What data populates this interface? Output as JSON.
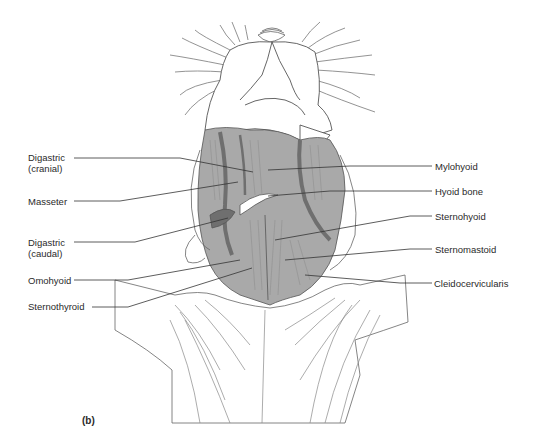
{
  "figure": {
    "panel_label": "(b)",
    "colors": {
      "muscle_fill": "#a9a9a9",
      "muscle_dark": "#6f6f6f",
      "muscle_shadow": "#8a8a8a",
      "outline": "#555555",
      "leader_line": "#333333",
      "background": "#ffffff"
    },
    "labels_left": [
      {
        "id": "digastric-cranial",
        "line1": "Digastric",
        "line2": "(cranial)"
      },
      {
        "id": "masseter",
        "line1": "Masseter",
        "line2": ""
      },
      {
        "id": "digastric-caudal",
        "line1": "Digastric",
        "line2": "(caudal)"
      },
      {
        "id": "omohyoid",
        "line1": "Omohyoid",
        "line2": ""
      },
      {
        "id": "sternothyroid",
        "line1": "Sternothyroid",
        "line2": ""
      }
    ],
    "labels_right": [
      {
        "id": "mylohyoid",
        "text": "Mylohyoid"
      },
      {
        "id": "hyoid-bone",
        "text": "Hyoid bone"
      },
      {
        "id": "sternohyoid",
        "text": "Sternohyoid"
      },
      {
        "id": "sternomastoid",
        "text": "Sternomastoid"
      },
      {
        "id": "cleidocervicularis",
        "text": "Cleidocervicularis"
      }
    ]
  }
}
